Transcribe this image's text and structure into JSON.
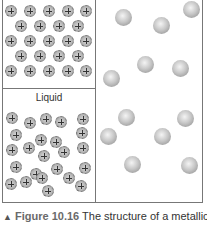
{
  "figure": {
    "panels": {
      "solid": {
        "label": "",
        "ion_symbol": "+"
      },
      "liquid": {
        "label": "Liquid",
        "ion_symbol": "+"
      },
      "gas": {
        "label": ""
      }
    },
    "caption": {
      "marker": "▲",
      "figure_number": "Figure 10.16",
      "text": " The structure of a metallic"
    }
  }
}
